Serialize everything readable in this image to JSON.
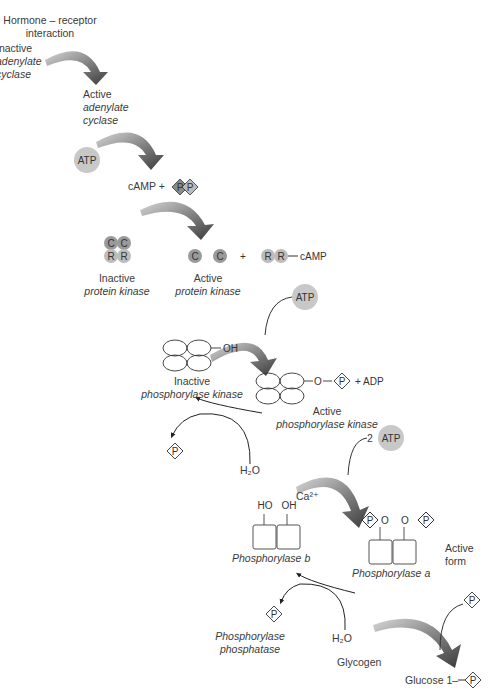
{
  "steps": {
    "hormone": [
      "Hormone – receptor",
      "interaction"
    ],
    "inactive_ac": [
      "Inactive",
      "adenylate",
      "cyclase"
    ],
    "active_ac": [
      "Active",
      "adenylate",
      "cyclase"
    ],
    "atp1": "ATP",
    "camp_plus": "cAMP +",
    "pp": [
      "P",
      "P"
    ],
    "inactive_pk": [
      "Inactive",
      "protein kinase"
    ],
    "active_pk": [
      "Active",
      "protein kinase"
    ],
    "plus1": "+",
    "rr_camp": "cAMP",
    "c_sub": "C",
    "r_sub": "R",
    "atp2": "ATP",
    "oh": "OH",
    "inactive_phk": [
      "Inactive",
      "phosphorylase kinase"
    ],
    "o_label": "O",
    "p_label": "P",
    "plus_adp": "+ ADP",
    "active_phk": [
      "Active",
      "phosphorylase kinase"
    ],
    "h2o": "H₂O",
    "two_atp": "2",
    "atp3": "ATP",
    "ca": "Ca²⁺",
    "ho": "HO",
    "phosphorylase_b": "Phosphorylase b",
    "phosphorylase_a": "Phosphorylase a",
    "active_form": [
      "Active",
      "form"
    ],
    "phosphatase": [
      "Phosphorylase",
      "phosphatase"
    ],
    "glycogen": "Glycogen",
    "glucose1": "Glucose 1–"
  },
  "colors": {
    "arrow_dark": "#3e3e3e",
    "arrow_light": "#cfcfcf",
    "circle_fill": "#c8c8c8",
    "catalytic_fill": "#9a9a9a",
    "regulatory_fill": "#bdbdbd",
    "pp_fill": "#8a8a8a"
  }
}
